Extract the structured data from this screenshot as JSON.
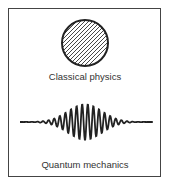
{
  "panel_top": {
    "label": "Classical physics",
    "figure": "hatched-circle"
  },
  "panel_bottom": {
    "label": "Quantum mechanics",
    "figure": "wave-packet"
  },
  "colors": {
    "stroke": "#222222",
    "background": "#ffffff"
  }
}
